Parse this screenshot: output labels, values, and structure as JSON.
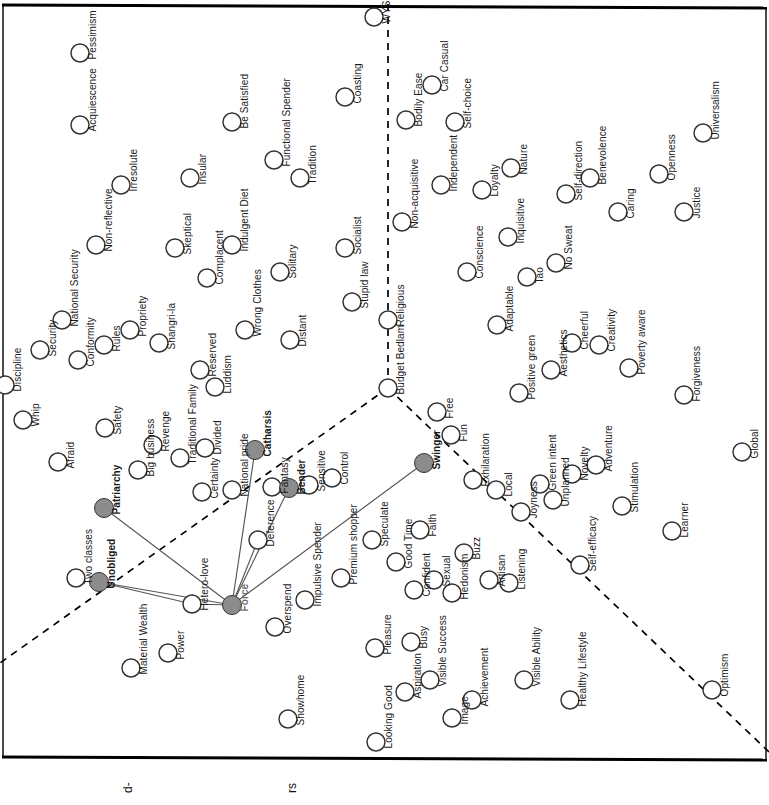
{
  "diagram": {
    "type": "semiotic-values-map",
    "orientation": "rotated-90",
    "background": "#ffffff",
    "border_color": "#000000",
    "node_outline_color": "#333333",
    "node_fill_empty": "#ffffff",
    "node_fill_highlight": "#8c8c8c",
    "link_color": "#555555",
    "divider_color": "#000000",
    "divider_style": "dashed",
    "node_radius": 9,
    "highlight_radius": 9.5,
    "hub": "Force",
    "highlighted_nodes": [
      "Force",
      "Patriarchy",
      "Unobliged",
      "Catharsis",
      "Bender",
      "Swinger"
    ],
    "axis_labels": [
      {
        "text": "d-",
        "x": 128,
        "y": 786
      },
      {
        "text": "rs",
        "x": 292,
        "y": 786
      }
    ],
    "dividers": [
      {
        "name": "vertical-religious-divider",
        "x1": 388,
        "y1": 4,
        "x2": 388,
        "y2": 388
      },
      {
        "name": "lower-left-divider",
        "x1": 388,
        "y1": 388,
        "x2": 0,
        "y2": 663
      },
      {
        "name": "lower-right-divider",
        "x1": 388,
        "y1": 388,
        "x2": 769,
        "y2": 752
      }
    ],
    "links": [
      {
        "from": "Force",
        "to": "Patriarchy"
      },
      {
        "from": "Force",
        "to": "Unobliged"
      },
      {
        "from": "Force",
        "to": "Catharsis"
      },
      {
        "from": "Force",
        "to": "Bender"
      },
      {
        "from": "Force",
        "to": "Swinger"
      },
      {
        "from": "Force",
        "to": "Hetero-love"
      },
      {
        "from": "Force",
        "to": "Deference"
      },
      {
        "from": "Unobliged",
        "to": "Hetero-love"
      }
    ],
    "nodes": [
      {
        "label": "Acquiescence",
        "cx": 80,
        "cy": 125,
        "fill": "empty"
      },
      {
        "label": "Pessimism",
        "cx": 80,
        "cy": 53,
        "fill": "empty"
      },
      {
        "label": "Irresolute",
        "cx": 121,
        "cy": 185,
        "fill": "empty"
      },
      {
        "label": "Non-reflective",
        "cx": 96,
        "cy": 245,
        "fill": "empty"
      },
      {
        "label": "Discipline",
        "cx": 5,
        "cy": 385,
        "fill": "empty"
      },
      {
        "label": "Whip",
        "cx": 23,
        "cy": 420,
        "fill": "empty"
      },
      {
        "label": "Security",
        "cx": 40,
        "cy": 350,
        "fill": "empty"
      },
      {
        "label": "National Security",
        "cx": 62,
        "cy": 320,
        "fill": "empty"
      },
      {
        "label": "Conformity",
        "cx": 78,
        "cy": 360,
        "fill": "empty"
      },
      {
        "label": "Rules",
        "cx": 104,
        "cy": 345,
        "fill": "empty"
      },
      {
        "label": "Propriety",
        "cx": 130,
        "cy": 330,
        "fill": "empty"
      },
      {
        "label": "Shangri-la",
        "cx": 159,
        "cy": 343,
        "fill": "empty"
      },
      {
        "label": "Afraid",
        "cx": 58,
        "cy": 462,
        "fill": "empty"
      },
      {
        "label": "Safety",
        "cx": 105,
        "cy": 428,
        "fill": "empty"
      },
      {
        "label": "Patriarchy",
        "cx": 104,
        "cy": 508,
        "fill": "highlight"
      },
      {
        "label": "Big business",
        "cx": 138,
        "cy": 470,
        "fill": "empty"
      },
      {
        "label": "Revenge",
        "cx": 153,
        "cy": 445,
        "fill": "empty"
      },
      {
        "label": "Traditional Family",
        "cx": 180,
        "cy": 458,
        "fill": "empty"
      },
      {
        "label": "Insular",
        "cx": 190,
        "cy": 178,
        "fill": "empty"
      },
      {
        "label": "Be Satisfied",
        "cx": 232,
        "cy": 122,
        "fill": "empty"
      },
      {
        "label": "Skeptical",
        "cx": 175,
        "cy": 248,
        "fill": "empty"
      },
      {
        "label": "Complacent",
        "cx": 207,
        "cy": 278,
        "fill": "empty"
      },
      {
        "label": "Indulgent Diet",
        "cx": 232,
        "cy": 245,
        "fill": "empty"
      },
      {
        "label": "Functional Spender",
        "cx": 274,
        "cy": 160,
        "fill": "empty"
      },
      {
        "label": "Tradition",
        "cx": 300,
        "cy": 178,
        "fill": "empty"
      },
      {
        "label": "Coasting",
        "cx": 345,
        "cy": 97,
        "fill": "empty"
      },
      {
        "label": "WYSIWYG",
        "cx": 374,
        "cy": 17,
        "fill": "empty"
      },
      {
        "label": "Solitary",
        "cx": 280,
        "cy": 272,
        "fill": "empty"
      },
      {
        "label": "Socialist",
        "cx": 345,
        "cy": 248,
        "fill": "empty"
      },
      {
        "label": "Stupid law",
        "cx": 352,
        "cy": 302,
        "fill": "empty"
      },
      {
        "label": "Religious",
        "cx": 388,
        "cy": 320,
        "fill": "empty"
      },
      {
        "label": "Budget Bedlam",
        "cx": 388,
        "cy": 388,
        "fill": "empty"
      },
      {
        "label": "Reserved",
        "cx": 200,
        "cy": 370,
        "fill": "empty"
      },
      {
        "label": "Luddism",
        "cx": 215,
        "cy": 387,
        "fill": "empty"
      },
      {
        "label": "Wrong Clothes",
        "cx": 245,
        "cy": 330,
        "fill": "empty"
      },
      {
        "label": "Distant",
        "cx": 290,
        "cy": 340,
        "fill": "empty"
      },
      {
        "label": "Divided",
        "cx": 205,
        "cy": 448,
        "fill": "empty"
      },
      {
        "label": "Certainty",
        "cx": 202,
        "cy": 492,
        "fill": "empty"
      },
      {
        "label": "Catharsis",
        "cx": 255,
        "cy": 450,
        "fill": "highlight"
      },
      {
        "label": "National pride",
        "cx": 232,
        "cy": 490,
        "fill": "empty"
      },
      {
        "label": "Fantasy",
        "cx": 272,
        "cy": 487,
        "fill": "empty"
      },
      {
        "label": "Bender",
        "cx": 289,
        "cy": 488,
        "fill": "highlight"
      },
      {
        "label": "Sensitive",
        "cx": 309,
        "cy": 485,
        "fill": "empty"
      },
      {
        "label": "Control",
        "cx": 332,
        "cy": 478,
        "fill": "empty"
      },
      {
        "label": "Deference",
        "cx": 258,
        "cy": 540,
        "fill": "empty"
      },
      {
        "label": "Two classes",
        "cx": 76,
        "cy": 578,
        "fill": "empty"
      },
      {
        "label": "Unobliged",
        "cx": 99,
        "cy": 582,
        "fill": "highlight"
      },
      {
        "label": "Hetero-love",
        "cx": 192,
        "cy": 604,
        "fill": "empty"
      },
      {
        "label": "Force",
        "cx": 232,
        "cy": 605,
        "fill": "highlight"
      },
      {
        "label": "Material Wealth",
        "cx": 131,
        "cy": 668,
        "fill": "empty"
      },
      {
        "label": "Power",
        "cx": 168,
        "cy": 653,
        "fill": "empty"
      },
      {
        "label": "Overspend",
        "cx": 275,
        "cy": 627,
        "fill": "empty"
      },
      {
        "label": "Impulsive Spender",
        "cx": 305,
        "cy": 600,
        "fill": "empty"
      },
      {
        "label": "Showhome",
        "cx": 288,
        "cy": 719,
        "fill": "empty"
      },
      {
        "label": "Premium shopper",
        "cx": 341,
        "cy": 578,
        "fill": "empty"
      },
      {
        "label": "Speculate",
        "cx": 372,
        "cy": 540,
        "fill": "empty"
      },
      {
        "label": "Pleasure",
        "cx": 375,
        "cy": 648,
        "fill": "empty"
      },
      {
        "label": "Looking Good",
        "cx": 376,
        "cy": 742,
        "fill": "empty"
      },
      {
        "label": "Aspiration",
        "cx": 405,
        "cy": 692,
        "fill": "empty"
      },
      {
        "label": "Busy",
        "cx": 411,
        "cy": 642,
        "fill": "empty"
      },
      {
        "label": "Visible Success",
        "cx": 430,
        "cy": 680,
        "fill": "empty"
      },
      {
        "label": "Image",
        "cx": 452,
        "cy": 718,
        "fill": "empty"
      },
      {
        "label": "Achievement",
        "cx": 472,
        "cy": 700,
        "fill": "empty"
      },
      {
        "label": "Good Time",
        "cx": 396,
        "cy": 562,
        "fill": "empty"
      },
      {
        "label": "Faith",
        "cx": 420,
        "cy": 530,
        "fill": "empty"
      },
      {
        "label": "Confident",
        "cx": 414,
        "cy": 590,
        "fill": "empty"
      },
      {
        "label": "Sexual",
        "cx": 434,
        "cy": 580,
        "fill": "empty"
      },
      {
        "label": "Hedonism",
        "cx": 452,
        "cy": 593,
        "fill": "empty"
      },
      {
        "label": "Buzz",
        "cx": 464,
        "cy": 553,
        "fill": "empty"
      },
      {
        "label": "Artisan",
        "cx": 489,
        "cy": 580,
        "fill": "empty"
      },
      {
        "label": "Listening",
        "cx": 509,
        "cy": 583,
        "fill": "empty"
      },
      {
        "label": "Visible Ability",
        "cx": 524,
        "cy": 680,
        "fill": "empty"
      },
      {
        "label": "Healthy Lifestyle",
        "cx": 570,
        "cy": 700,
        "fill": "empty"
      },
      {
        "label": "Self-efficacy",
        "cx": 580,
        "cy": 565,
        "fill": "empty"
      },
      {
        "label": "Swinger",
        "cx": 424,
        "cy": 463,
        "fill": "highlight"
      },
      {
        "label": "Free",
        "cx": 437,
        "cy": 412,
        "fill": "empty"
      },
      {
        "label": "Fun",
        "cx": 451,
        "cy": 435,
        "fill": "empty"
      },
      {
        "label": "Exhilaration",
        "cx": 473,
        "cy": 480,
        "fill": "empty"
      },
      {
        "label": "Local",
        "cx": 496,
        "cy": 490,
        "fill": "empty"
      },
      {
        "label": "Joyness",
        "cx": 521,
        "cy": 512,
        "fill": "empty"
      },
      {
        "label": "Green intent",
        "cx": 540,
        "cy": 484,
        "fill": "empty"
      },
      {
        "label": "Unplanned",
        "cx": 553,
        "cy": 500,
        "fill": "empty"
      },
      {
        "label": "Novelty",
        "cx": 572,
        "cy": 474,
        "fill": "empty"
      },
      {
        "label": "Adventure",
        "cx": 596,
        "cy": 465,
        "fill": "empty"
      },
      {
        "label": "Stimulation",
        "cx": 622,
        "cy": 506,
        "fill": "empty"
      },
      {
        "label": "Learner",
        "cx": 672,
        "cy": 531,
        "fill": "empty"
      },
      {
        "label": "Global",
        "cx": 742,
        "cy": 452,
        "fill": "empty"
      },
      {
        "label": "Optimism",
        "cx": 712,
        "cy": 690,
        "fill": "empty"
      },
      {
        "label": "Adaptable",
        "cx": 497,
        "cy": 325,
        "fill": "empty"
      },
      {
        "label": "Positive green",
        "cx": 519,
        "cy": 393,
        "fill": "empty"
      },
      {
        "label": "Aesthetics",
        "cx": 551,
        "cy": 370,
        "fill": "empty"
      },
      {
        "label": "Cheerful",
        "cx": 572,
        "cy": 343,
        "fill": "empty"
      },
      {
        "label": "Creativity",
        "cx": 599,
        "cy": 345,
        "fill": "empty"
      },
      {
        "label": "Poverty aware",
        "cx": 629,
        "cy": 368,
        "fill": "empty"
      },
      {
        "label": "Forgiveness",
        "cx": 684,
        "cy": 395,
        "fill": "empty"
      },
      {
        "label": "Conscience",
        "cx": 467,
        "cy": 272,
        "fill": "empty"
      },
      {
        "label": "Inquisitive",
        "cx": 508,
        "cy": 237,
        "fill": "empty"
      },
      {
        "label": "Tao",
        "cx": 527,
        "cy": 277,
        "fill": "empty"
      },
      {
        "label": "No Sweat",
        "cx": 556,
        "cy": 263,
        "fill": "empty"
      },
      {
        "label": "Self-direction",
        "cx": 566,
        "cy": 194,
        "fill": "empty"
      },
      {
        "label": "Benevolence",
        "cx": 590,
        "cy": 178,
        "fill": "empty"
      },
      {
        "label": "Caring",
        "cx": 618,
        "cy": 212,
        "fill": "empty"
      },
      {
        "label": "Openness",
        "cx": 659,
        "cy": 174,
        "fill": "empty"
      },
      {
        "label": "Justice",
        "cx": 684,
        "cy": 212,
        "fill": "empty"
      },
      {
        "label": "Universalism",
        "cx": 703,
        "cy": 133,
        "fill": "empty"
      },
      {
        "label": "Non-acquisitive",
        "cx": 402,
        "cy": 222,
        "fill": "empty"
      },
      {
        "label": "Bodily Ease",
        "cx": 406,
        "cy": 120,
        "fill": "empty"
      },
      {
        "label": "Car Casual",
        "cx": 432,
        "cy": 85,
        "fill": "empty"
      },
      {
        "label": "Self-choice",
        "cx": 455,
        "cy": 122,
        "fill": "empty"
      },
      {
        "label": "Independent",
        "cx": 441,
        "cy": 185,
        "fill": "empty"
      },
      {
        "label": "Loyalty",
        "cx": 482,
        "cy": 190,
        "fill": "empty"
      },
      {
        "label": "Nature",
        "cx": 511,
        "cy": 168,
        "fill": "empty"
      }
    ]
  }
}
